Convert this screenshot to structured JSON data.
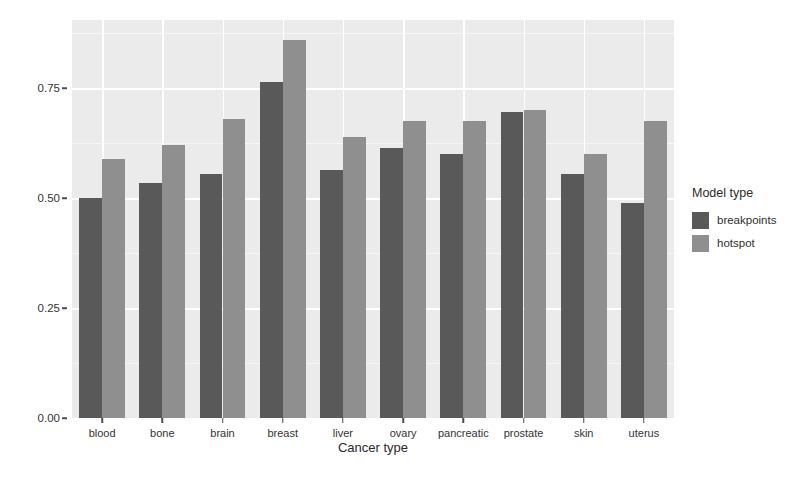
{
  "chart_data": {
    "type": "bar",
    "title": "",
    "xlabel": "Cancer type",
    "ylabel": "Median test ROC AUC",
    "categories": [
      "blood",
      "bone",
      "brain",
      "breast",
      "liver",
      "ovary",
      "pancreatic",
      "prostate",
      "skin",
      "uterus"
    ],
    "series": [
      {
        "name": "breakpoints",
        "color": "#595959",
        "values": [
          0.5,
          0.535,
          0.555,
          0.765,
          0.565,
          0.615,
          0.6,
          0.695,
          0.555,
          0.49
        ]
      },
      {
        "name": "hotspot",
        "color": "#8f8f8f",
        "values": [
          0.59,
          0.62,
          0.68,
          0.86,
          0.64,
          0.675,
          0.675,
          0.7,
          0.6,
          0.675
        ]
      }
    ],
    "ylim": [
      0.0,
      0.905
    ],
    "yticks": [
      0.0,
      0.25,
      0.5,
      0.75
    ],
    "ytick_labels": [
      "0.00",
      "0.25",
      "0.50",
      "0.75"
    ],
    "yticks_minor": [
      0.125,
      0.375,
      0.625,
      0.875
    ],
    "grid": true,
    "legend": {
      "title": "Model type",
      "position": "right",
      "entries": [
        {
          "label": "breakpoints",
          "color": "#595959"
        },
        {
          "label": "hotspot",
          "color": "#8f8f8f"
        }
      ]
    },
    "panel_background": "#ebebeb",
    "grid_color": "#ffffff"
  }
}
